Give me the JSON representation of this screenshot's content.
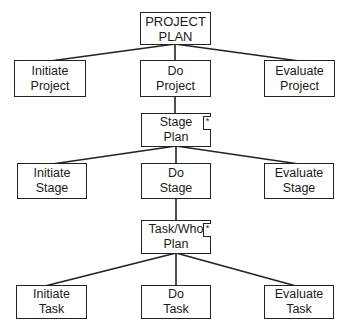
{
  "diagram": {
    "type": "hierarchy",
    "nodes": {
      "project_plan": {
        "line1": "PROJECT",
        "line2": "PLAN"
      },
      "initiate_project": {
        "line1": "Initiate",
        "line2": "Project"
      },
      "do_project": {
        "line1": "Do",
        "line2": "Project"
      },
      "evaluate_project": {
        "line1": "Evaluate",
        "line2": "Project"
      },
      "stage_plan": {
        "line1": "Stage",
        "line2": "Plan",
        "marker": "*"
      },
      "initiate_stage": {
        "line1": "Initiate",
        "line2": "Stage"
      },
      "do_stage": {
        "line1": "Do",
        "line2": "Stage"
      },
      "evaluate_stage": {
        "line1": "Evaluate",
        "line2": "Stage"
      },
      "task_who_plan": {
        "line1": "Task/Who",
        "line2": "Plan",
        "marker": "*"
      },
      "initiate_task": {
        "line1": "Initiate",
        "line2": "Task"
      },
      "do_task": {
        "line1": "Do",
        "line2": "Task"
      },
      "evaluate_task": {
        "line1": "Evaluate",
        "line2": "Task"
      }
    },
    "edges": [
      [
        "project_plan",
        "initiate_project"
      ],
      [
        "project_plan",
        "do_project"
      ],
      [
        "project_plan",
        "evaluate_project"
      ],
      [
        "do_project",
        "stage_plan"
      ],
      [
        "stage_plan",
        "initiate_stage"
      ],
      [
        "stage_plan",
        "do_stage"
      ],
      [
        "stage_plan",
        "evaluate_stage"
      ],
      [
        "do_stage",
        "task_who_plan"
      ],
      [
        "task_who_plan",
        "initiate_task"
      ],
      [
        "task_who_plan",
        "do_task"
      ],
      [
        "task_who_plan",
        "evaluate_task"
      ]
    ]
  }
}
